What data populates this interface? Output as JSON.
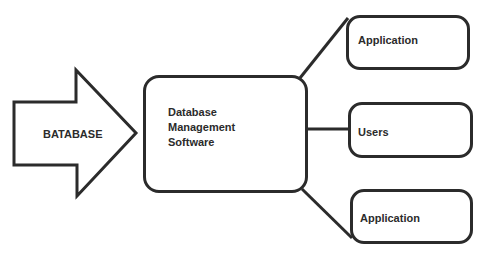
{
  "diagram": {
    "source_arrow": {
      "label": "BATABASE"
    },
    "center_box": {
      "lines": [
        "Database",
        "Management",
        "Software"
      ]
    },
    "targets": [
      {
        "label": "Application"
      },
      {
        "label": "Users"
      },
      {
        "label": "Application"
      }
    ],
    "colors": {
      "stroke": "#2b2b2b",
      "background": "#ffffff",
      "text": "#2b2b2b"
    }
  }
}
